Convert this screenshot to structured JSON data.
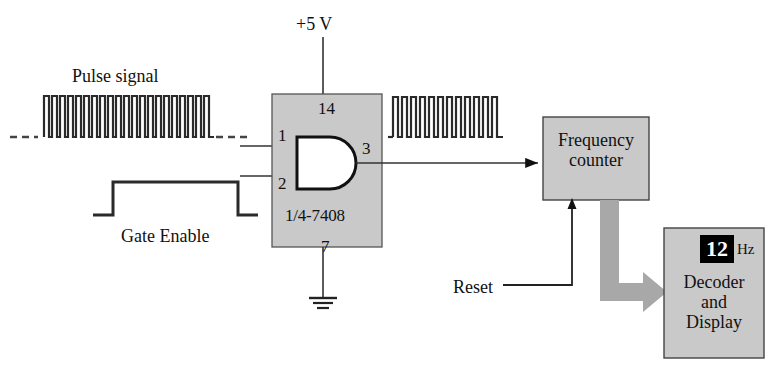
{
  "diagram": {
    "colors": {
      "ic_fill": "#c9c9c9",
      "box_fill": "#c9c9c9",
      "gate_fill": "#ffffff",
      "line": "#111111",
      "gray_arrow": "#a8a8a8",
      "display_bg": "#000000",
      "display_text": "#ffffff"
    }
  },
  "labels": {
    "pulse_signal": "Pulse signal",
    "gate_enable": "Gate Enable",
    "supply": "+5 V",
    "reset": "Reset",
    "hz_unit": "Hz"
  },
  "ic": {
    "part_number": "1/4-7408",
    "pins": {
      "vcc": "14",
      "input_a": "1",
      "input_b": "2",
      "output": "3",
      "gnd": "7"
    }
  },
  "blocks": {
    "frequency_counter": "Frequency\ncounter",
    "frequency_counter_line1": "Frequency",
    "frequency_counter_line2": "counter",
    "decoder_display_line1": "Decoder",
    "decoder_display_line2": "and",
    "decoder_display_line3": "Display"
  },
  "display": {
    "value": "12",
    "unit": "Hz"
  },
  "waveforms": {
    "input_pulse_train": {
      "name": "pulse-signal-waveform",
      "pulse_count": 21,
      "has_dashed_continuation": true
    },
    "gate_enable_pulse": {
      "name": "gate-enable-waveform",
      "pulse_count": 1
    },
    "output_pulse_train": {
      "name": "gated-output-waveform",
      "pulse_count": 12
    }
  }
}
